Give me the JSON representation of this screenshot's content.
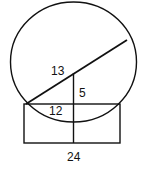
{
  "diagram": {
    "labels": {
      "hypotenuse": "13",
      "vertical_leg": "5",
      "horizontal_leg": "12",
      "rectangle_width": "24"
    },
    "stroke_color": "#111111",
    "background_color": "#ffffff"
  }
}
